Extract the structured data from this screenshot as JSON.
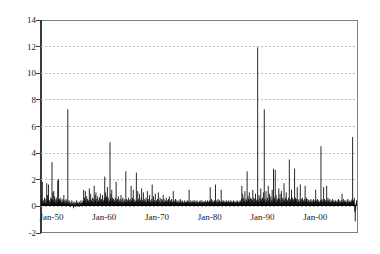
{
  "chart_data": {
    "type": "bar",
    "title": "",
    "subtitle": "",
    "xlabel": "",
    "ylabel": "",
    "grid": true,
    "legend": null,
    "ylim": [
      -2,
      14
    ],
    "yticks": [
      -2,
      0,
      2,
      4,
      6,
      8,
      10,
      12,
      14
    ],
    "ytick_labels": [
      "-2",
      "0",
      "2",
      "4",
      "6",
      "8",
      "10",
      "12",
      "14"
    ],
    "x_start_label": "Jan-48",
    "x_end_label": "Dec-06",
    "xticks": [
      "Jan-50",
      "Jan-60",
      "Jan-70",
      "Jan-80",
      "Jan-90",
      "Jan-00"
    ],
    "xtick_labels": [
      "Jan-50",
      "Jan-60",
      "Jan-70",
      "Jan-80",
      "Jan-90",
      "Jan-00"
    ],
    "x_tick_index": [
      24,
      144,
      264,
      384,
      504,
      624
    ],
    "n_points": 708,
    "bar_color": "#000000",
    "grid_color": "#b9b9b9",
    "axis_color": "#3a3a3a",
    "frame_color": "#808080",
    "values": [
      0.2,
      0.1,
      0.5,
      1.8,
      0.3,
      0.1,
      0.4,
      0.2,
      0.6,
      0.1,
      0.2,
      0.5,
      0.3,
      1.7,
      0.2,
      0.8,
      0.4,
      1.6,
      0.2,
      0.4,
      0.1,
      0.3,
      0.6,
      0.2,
      0.5,
      3.3,
      0.4,
      1.0,
      0.3,
      1.1,
      0.2,
      0.7,
      0.4,
      0.2,
      0.5,
      0.3,
      0.6,
      0.2,
      1.9,
      0.4,
      2.0,
      0.3,
      0.5,
      0.2,
      0.4,
      0.6,
      0.3,
      0.2,
      0.4,
      0.2,
      0.5,
      0.3,
      0.8,
      0.2,
      0.4,
      0.1,
      0.3,
      0.5,
      0.2,
      0.4,
      0.2,
      7.3,
      0.3,
      0.1,
      0.4,
      0.2,
      0.3,
      -0.1,
      0.2,
      0.1,
      0.4,
      0.2,
      0.1,
      0.3,
      -0.2,
      0.2,
      0.1,
      0.3,
      0.2,
      -0.1,
      0.2,
      0.4,
      0.1,
      0.2,
      0.3,
      0.1,
      0.2,
      -0.1,
      0.3,
      0.2,
      0.1,
      0.4,
      0.2,
      0.1,
      0.3,
      0.2,
      0.4,
      1.2,
      0.3,
      0.6,
      0.2,
      1.1,
      0.4,
      0.2,
      0.7,
      0.3,
      0.5,
      0.2,
      0.4,
      0.3,
      1.3,
      0.2,
      0.5,
      0.9,
      0.3,
      0.4,
      0.2,
      0.6,
      0.3,
      0.2,
      0.5,
      1.5,
      0.3,
      0.8,
      0.4,
      1.0,
      0.2,
      0.5,
      0.3,
      0.7,
      0.2,
      0.4,
      0.3,
      0.6,
      0.2,
      0.9,
      0.4,
      0.3,
      0.5,
      0.2,
      0.8,
      0.3,
      0.4,
      0.2,
      0.6,
      2.2,
      0.4,
      1.0,
      0.3,
      0.7,
      0.5,
      1.4,
      0.3,
      0.6,
      0.2,
      0.4,
      0.3,
      4.8,
      0.5,
      0.9,
      0.3,
      1.2,
      0.4,
      0.6,
      0.2,
      0.5,
      0.3,
      0.4,
      0.2,
      0.6,
      0.3,
      1.8,
      0.4,
      0.2,
      0.5,
      0.3,
      0.7,
      0.2,
      0.4,
      0.3,
      0.5,
      0.2,
      0.8,
      0.3,
      0.4,
      0.2,
      0.6,
      0.3,
      0.2,
      0.5,
      0.3,
      0.4,
      0.2,
      2.6,
      0.3,
      0.5,
      0.2,
      0.4,
      0.3,
      0.6,
      0.2,
      0.4,
      0.3,
      0.5,
      0.2,
      1.5,
      0.4,
      0.3,
      0.6,
      0.2,
      1.2,
      0.3,
      0.5,
      0.2,
      0.4,
      0.3,
      0.2,
      2.5,
      0.4,
      0.3,
      1.1,
      0.2,
      0.5,
      0.3,
      0.9,
      0.2,
      0.4,
      0.3,
      0.6,
      1.3,
      0.2,
      0.4,
      0.3,
      1.0,
      0.2,
      0.5,
      0.3,
      0.4,
      0.2,
      0.6,
      0.3,
      0.2,
      1.1,
      0.4,
      0.3,
      0.5,
      0.2,
      0.8,
      0.3,
      0.2,
      0.4,
      0.3,
      0.5,
      1.6,
      0.2,
      0.3,
      0.7,
      0.2,
      0.4,
      0.3,
      0.9,
      0.2,
      0.3,
      0.4,
      0.2,
      0.5,
      0.3,
      1.0,
      0.2,
      0.4,
      0.3,
      0.6,
      0.2,
      0.3,
      0.5,
      0.2,
      0.4,
      0.3,
      0.8,
      0.2,
      0.5,
      0.3,
      0.2,
      0.4,
      0.3,
      0.6,
      0.2,
      0.3,
      0.4,
      0.2,
      0.5,
      0.3,
      0.7,
      0.2,
      0.3,
      0.4,
      0.2,
      0.5,
      0.3,
      0.2,
      0.3,
      1.1,
      0.2,
      0.4,
      0.3,
      0.2,
      0.5,
      0.3,
      0.2,
      0.4,
      0.3,
      0.2,
      0.3,
      0.2,
      0.4,
      0.2,
      0.3,
      0.5,
      0.2,
      0.3,
      0.2,
      0.4,
      0.3,
      0.2,
      0.2,
      0.3,
      0.2,
      0.4,
      0.2,
      0.3,
      0.2,
      0.3,
      0.2,
      0.4,
      0.2,
      0.3,
      0.3,
      1.2,
      0.2,
      0.3,
      0.2,
      0.4,
      0.2,
      0.3,
      0.2,
      0.3,
      0.4,
      0.2,
      0.3,
      0.2,
      0.4,
      0.3,
      0.2,
      0.3,
      0.2,
      0.4,
      0.2,
      0.3,
      0.2,
      0.3,
      0.2,
      0.3,
      0.4,
      0.2,
      0.3,
      0.2,
      0.4,
      0.2,
      0.3,
      0.2,
      0.3,
      0.2,
      0.3,
      0.2,
      0.4,
      0.2,
      0.3,
      0.2,
      0.3,
      0.4,
      0.2,
      0.3,
      0.2,
      0.3,
      0.4,
      1.4,
      0.3,
      0.2,
      0.5,
      0.3,
      0.2,
      0.4,
      0.3,
      0.2,
      0.3,
      0.4,
      0.2,
      1.6,
      0.3,
      0.2,
      0.4,
      0.3,
      0.2,
      0.5,
      0.3,
      0.2,
      0.4,
      0.3,
      0.2,
      0.3,
      1.2,
      0.2,
      0.4,
      0.3,
      0.2,
      0.3,
      0.4,
      0.2,
      0.3,
      0.2,
      0.3,
      0.2,
      0.4,
      0.3,
      0.2,
      0.3,
      0.2,
      0.4,
      0.3,
      0.2,
      0.3,
      0.2,
      0.4,
      0.3,
      0.2,
      0.3,
      0.2,
      0.3,
      0.4,
      0.2,
      0.3,
      0.2,
      0.3,
      0.2,
      0.3,
      0.2,
      0.4,
      0.3,
      0.2,
      0.3,
      0.2,
      0.3,
      0.2,
      0.4,
      0.3,
      0.2,
      0.5,
      1.5,
      0.3,
      0.9,
      0.2,
      0.6,
      0.4,
      0.3,
      1.1,
      0.2,
      0.5,
      0.3,
      0.4,
      2.6,
      0.3,
      0.7,
      0.5,
      0.2,
      1.0,
      0.4,
      0.3,
      0.6,
      0.2,
      0.5,
      0.3,
      0.4,
      1.2,
      0.2,
      0.6,
      0.3,
      0.5,
      0.2,
      0.9,
      0.3,
      0.4,
      0.2,
      0.5,
      12.0,
      0.4,
      0.3,
      0.8,
      0.2,
      0.6,
      0.4,
      1.3,
      0.3,
      0.5,
      0.2,
      0.6,
      0.3,
      1.0,
      0.4,
      7.3,
      0.3,
      0.5,
      0.2,
      1.1,
      0.4,
      0.3,
      0.6,
      0.2,
      1.5,
      0.4,
      0.3,
      0.9,
      0.5,
      0.2,
      0.7,
      0.3,
      0.4,
      1.2,
      0.2,
      0.5,
      2.8,
      0.3,
      0.6,
      0.4,
      2.7,
      0.2,
      0.8,
      0.3,
      0.5,
      0.4,
      0.2,
      0.6,
      1.3,
      0.3,
      0.5,
      0.9,
      0.2,
      0.4,
      1.1,
      0.3,
      0.6,
      0.2,
      0.5,
      0.3,
      1.7,
      0.4,
      0.2,
      0.6,
      0.3,
      1.0,
      0.5,
      0.2,
      0.4,
      0.3,
      0.6,
      0.2,
      3.5,
      0.3,
      0.5,
      0.4,
      0.2,
      1.2,
      0.3,
      0.6,
      0.4,
      0.2,
      0.5,
      0.3,
      2.8,
      0.4,
      0.6,
      0.2,
      0.5,
      0.3,
      1.4,
      0.2,
      0.4,
      0.3,
      0.5,
      0.2,
      0.3,
      1.6,
      0.4,
      0.2,
      0.5,
      0.3,
      0.6,
      0.2,
      0.4,
      0.3,
      0.2,
      0.5,
      1.5,
      0.3,
      0.4,
      0.6,
      0.2,
      0.3,
      0.5,
      0.2,
      0.4,
      0.3,
      0.2,
      0.4,
      0.3,
      0.5,
      0.2,
      0.3,
      0.4,
      0.2,
      0.3,
      0.5,
      0.2,
      0.3,
      0.4,
      0.3,
      1.2,
      0.2,
      0.4,
      0.3,
      0.5,
      0.2,
      0.3,
      0.4,
      0.2,
      0.3,
      0.2,
      0.4,
      4.5,
      0.3,
      0.5,
      0.2,
      0.4,
      0.3,
      1.4,
      0.2,
      0.5,
      0.3,
      0.4,
      0.2,
      0.3,
      1.5,
      0.4,
      0.2,
      0.6,
      0.3,
      0.4,
      0.2,
      0.5,
      0.3,
      0.2,
      0.4,
      0.3,
      0.2,
      0.5,
      0.3,
      0.2,
      0.4,
      0.3,
      0.2,
      0.3,
      0.4,
      0.2,
      0.3,
      0.2,
      0.4,
      0.3,
      0.2,
      0.5,
      0.3,
      0.2,
      0.4,
      0.3,
      0.2,
      0.3,
      0.4,
      0.9,
      0.2,
      0.3,
      0.5,
      0.2,
      0.4,
      0.3,
      0.2,
      0.3,
      0.4,
      0.2,
      0.3,
      0.2,
      0.5,
      0.3,
      0.2,
      0.4,
      0.3,
      0.2,
      0.3,
      0.2,
      0.4,
      0.3,
      0.5,
      5.2,
      0.3,
      0.4,
      0.2,
      0.6,
      -0.5,
      -1.2,
      -0.3,
      0.2,
      0.4,
      0.3
    ]
  }
}
